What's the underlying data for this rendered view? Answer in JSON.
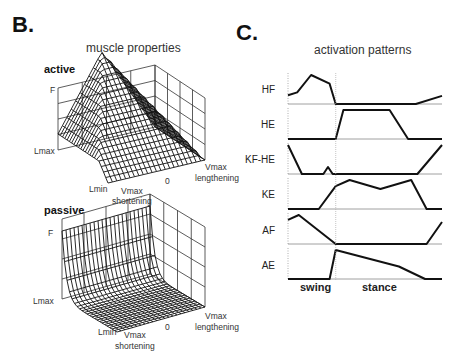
{
  "panel_b": {
    "letter": "B.",
    "title": "muscle properties",
    "active": {
      "label": "active",
      "f_axis": "F",
      "lmax": "Lmax",
      "lmin": "Lmin",
      "vmax_short": "Vmax",
      "shortening": "shortening",
      "zero": "0",
      "vmax_long": "Vmax",
      "lengthening": "lengthening"
    },
    "passive": {
      "label": "passive",
      "f_axis": "F",
      "lmax": "Lmax",
      "lmin": "Lmin",
      "vmax_short": "Vmax",
      "shortening": "shortening",
      "zero": "0",
      "vmax_long": "Vmax",
      "lengthening": "lengthening"
    }
  },
  "panel_c": {
    "letter": "C.",
    "title": "activation patterns",
    "phases": {
      "swing": "swing",
      "stance": "stance"
    },
    "rows": [
      {
        "label": "HF"
      },
      {
        "label": "HE"
      },
      {
        "label": "KF-HE"
      },
      {
        "label": "KE"
      },
      {
        "label": "AF"
      },
      {
        "label": "AE"
      }
    ]
  },
  "chart_data": [
    {
      "type": "surface",
      "title": "muscle properties — active",
      "axes": {
        "x": [
          "Lmin",
          "Lmax"
        ],
        "y": [
          "Vmax shortening",
          "0",
          "Vmax lengthening"
        ],
        "z": "F"
      },
      "description": "Pyramid-shaped force surface peaking at Lmax-opposite corner near V=0 optimum"
    },
    {
      "type": "surface",
      "title": "muscle properties — passive",
      "axes": {
        "x": [
          "Lmin",
          "Lmax"
        ],
        "y": [
          "Vmax shortening",
          "0",
          "Vmax lengthening"
        ],
        "z": "F"
      },
      "description": "Passive force flat near zero, rising steeply toward Lmax independent of velocity"
    },
    {
      "type": "line",
      "title": "activation patterns",
      "xlabel": "gait cycle (swing | stance)",
      "x_range": [
        0,
        1
      ],
      "swing_stance_boundary": 0.31,
      "ylabel": "activation (normalized)",
      "series": [
        {
          "name": "HF",
          "x": [
            0,
            0.06,
            0.15,
            0.27,
            0.31,
            0.83,
            1.0
          ],
          "y": [
            0.3,
            0.4,
            1.0,
            0.7,
            0.0,
            0.0,
            0.28
          ]
        },
        {
          "name": "HE",
          "x": [
            0,
            0.31,
            0.36,
            0.66,
            0.78,
            1.0
          ],
          "y": [
            0.0,
            0.0,
            1.0,
            1.0,
            0.0,
            0.0
          ]
        },
        {
          "name": "KF-HE",
          "x": [
            0,
            0.09,
            0.23,
            0.26,
            0.29,
            0.84,
            1.0
          ],
          "y": [
            1.0,
            0.0,
            0.0,
            0.24,
            0.0,
            0.0,
            1.0
          ]
        },
        {
          "name": "KE",
          "x": [
            0,
            0.2,
            0.31,
            0.4,
            0.6,
            0.8,
            0.9,
            1.0
          ],
          "y": [
            0.0,
            0.0,
            0.79,
            1.0,
            0.69,
            1.0,
            0.0,
            0.0
          ]
        },
        {
          "name": "AF",
          "x": [
            0,
            0.07,
            0.31,
            0.9,
            1.0
          ],
          "y": [
            0.83,
            1.0,
            0.0,
            0.0,
            0.76
          ]
        },
        {
          "name": "AE",
          "x": [
            0,
            0.27,
            0.31,
            0.72,
            0.89,
            1.0
          ],
          "y": [
            0.0,
            0.0,
            1.0,
            0.43,
            0.0,
            0.0
          ]
        }
      ]
    }
  ]
}
